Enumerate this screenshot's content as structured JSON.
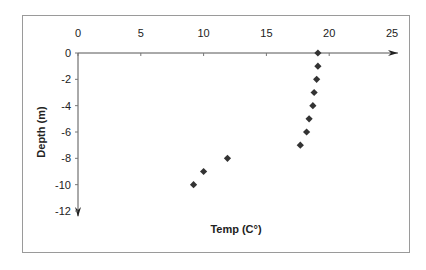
{
  "chart_data": {
    "type": "scatter",
    "title": "",
    "xlabel": "Temp (C°)",
    "ylabel": "Depth (m)",
    "xlim": [
      0,
      25
    ],
    "ylim": [
      -12,
      0
    ],
    "x_ticks": [
      0,
      5,
      10,
      15,
      20,
      25
    ],
    "y_ticks": [
      0,
      -2,
      -4,
      -6,
      -8,
      -10,
      -12
    ],
    "x_tick_labels": [
      "0",
      "5",
      "10",
      "15",
      "20",
      "25"
    ],
    "y_tick_labels": [
      "0",
      "-2",
      "-4",
      "-6",
      "-8",
      "-10",
      "-12"
    ],
    "x_axis_position": "top",
    "grid": false,
    "legend": null,
    "marker": "diamond",
    "marker_color": "#333333",
    "series": [
      {
        "name": "Temperature profile",
        "points": [
          {
            "x": 19.1,
            "y": 0
          },
          {
            "x": 19.1,
            "y": -1
          },
          {
            "x": 19.0,
            "y": -2
          },
          {
            "x": 18.8,
            "y": -3
          },
          {
            "x": 18.7,
            "y": -4
          },
          {
            "x": 18.4,
            "y": -5
          },
          {
            "x": 18.2,
            "y": -6
          },
          {
            "x": 17.7,
            "y": -7
          },
          {
            "x": 11.9,
            "y": -8
          },
          {
            "x": 10.0,
            "y": -9
          },
          {
            "x": 9.2,
            "y": -10
          }
        ]
      }
    ]
  }
}
